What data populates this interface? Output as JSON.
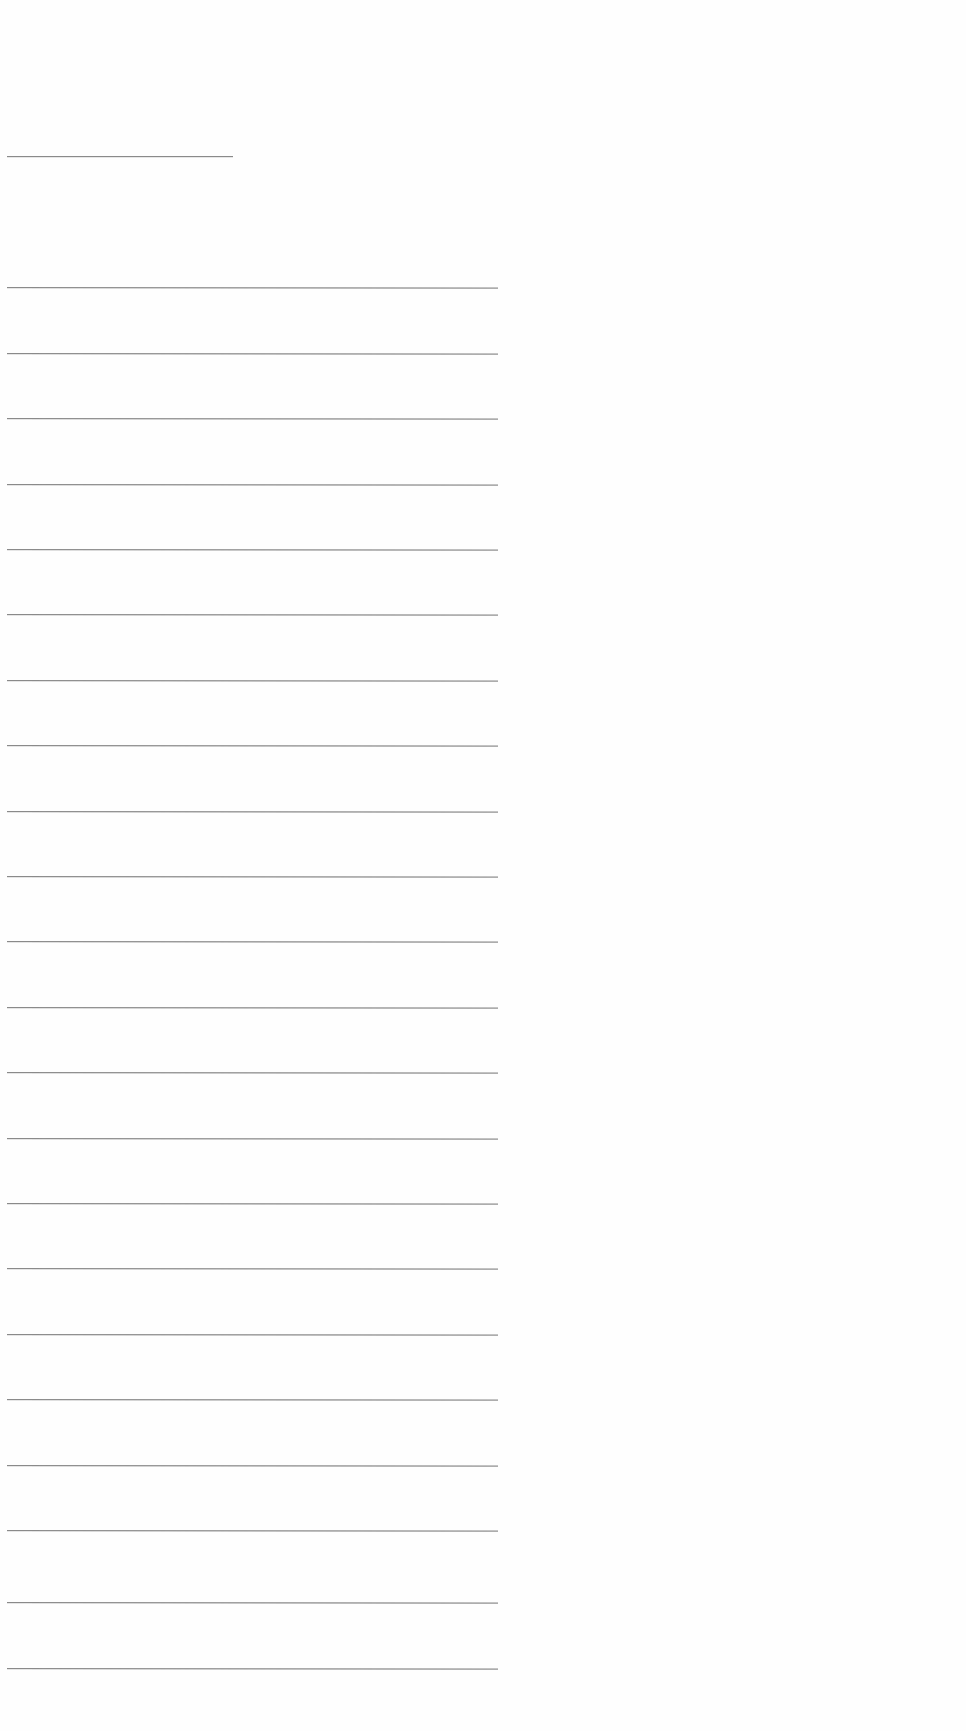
{
  "document": {
    "type": "blank lined page",
    "background_color": "#fefefe",
    "rule_color": "#8a8a8a",
    "title_line": {
      "y": 156,
      "x_start": 7,
      "x_end": 233
    },
    "rule_lines": {
      "x_start": 7,
      "x_end": 498,
      "y_positions": [
        287,
        353,
        418,
        484,
        549,
        614,
        680,
        745,
        811,
        876,
        941,
        1007,
        1072,
        1138,
        1203,
        1268,
        1334,
        1399,
        1465,
        1530,
        1602,
        1668
      ]
    },
    "text_content": []
  }
}
